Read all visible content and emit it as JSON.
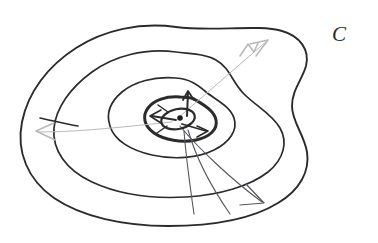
{
  "figure": {
    "background_color": "#ffffff",
    "ink_color": "#2b2b2b",
    "faint_ink_color": "#b9b9bd",
    "vector_ink_color": "#55555c",
    "width": 378,
    "height": 243
  },
  "labels": {
    "outer_curve": {
      "text": "C",
      "x": 338,
      "y": 28,
      "font_size": 21
    }
  },
  "contours": {
    "count": 4,
    "description": "Four nested closed hand-drawn curves, outermost labelled C",
    "items": [
      {
        "name": "outer-contour",
        "level": 1,
        "stroke_width": 1.9,
        "path": "M 176 27 C 140 22 104 30 76 48 C 48 66 28 92 22 122 C 16 152 28 180 54 198 C 82 217 124 226 168 226 C 212 226 252 219 278 203 C 300 190 310 171 307 152 C 304 134 292 122 292 106 C 292 90 302 80 306 66 C 310 50 300 36 282 31 C 258 24 212 32 176 27 Z"
      },
      {
        "name": "second-contour",
        "level": 2,
        "stroke_width": 1.7,
        "path": "M 176 52 C 144 48 114 56 92 72 C 70 88 56 108 54 128 C 52 150 66 170 92 182 C 118 194 152 199 186 197 C 220 195 250 186 268 172 C 284 159 288 142 280 128 C 272 114 256 106 244 94 C 232 82 230 68 216 60 C 206 54 192 54 176 52 Z"
      },
      {
        "name": "third-contour",
        "level": 3,
        "stroke_width": 1.7,
        "path": "M 176 78 C 154 76 134 82 122 92 C 110 102 106 114 110 126 C 114 140 130 150 152 155 C 174 160 198 158 214 150 C 230 142 238 130 234 118 C 230 106 216 100 206 92 C 198 85 190 79 176 78 Z"
      },
      {
        "name": "inner-contour",
        "level": 4,
        "stroke_width": 3.0,
        "path": "M 180 97 C 166 96 154 100 148 108 C 142 116 144 126 154 133 C 164 140 182 143 196 140 C 210 137 218 129 216 120 C 214 110 202 104 194 99 C 189 97 185 97 180 97 Z"
      }
    ]
  },
  "center_feature": {
    "name": "critical-point",
    "description": "Small filled oval with a solid dot at the center of the innermost contour",
    "oval": {
      "cx": 178,
      "cy": 119,
      "rx": 17,
      "ry": 10,
      "rotation": -12,
      "stroke_width": 2.2
    },
    "dot": {
      "cx": 180,
      "cy": 118,
      "r": 2.6,
      "color": "#1f1f1f"
    }
  },
  "vectors": {
    "description": "Arrows radiating from the centre critical point outwards",
    "items": [
      {
        "name": "vector-upper-right",
        "direction": "up-right",
        "style": "faint",
        "from": [
          178,
          118
        ],
        "to": [
          268,
          40
        ],
        "arrowhead": [
          [
            250,
            44
          ],
          [
            268,
            40
          ],
          [
            256,
            56
          ]
        ]
      },
      {
        "name": "vector-lower-right",
        "direction": "down-right",
        "style": "solid",
        "from": [
          178,
          126
        ],
        "to": [
          262,
          200
        ],
        "arrowhead": [
          [
            246,
            186
          ],
          [
            264,
            202
          ],
          [
            242,
            204
          ]
        ]
      },
      {
        "name": "vector-down",
        "direction": "down",
        "style": "solid",
        "from": [
          186,
          130
        ],
        "to": [
          232,
          212
        ],
        "arrowhead": null
      },
      {
        "name": "vector-left",
        "direction": "left",
        "style": "faint",
        "from": [
          172,
          122
        ],
        "to": [
          36,
          132
        ],
        "arrowhead": [
          [
            52,
            124
          ],
          [
            34,
            132
          ],
          [
            52,
            140
          ]
        ]
      },
      {
        "name": "vector-up-short",
        "direction": "up",
        "style": "solid",
        "from": [
          186,
          116
        ],
        "to": [
          188,
          93
        ],
        "arrowhead": [
          [
            183,
            100
          ],
          [
            188,
            92
          ],
          [
            193,
            100
          ]
        ]
      },
      {
        "name": "vector-left-short",
        "direction": "left-short",
        "style": "solid",
        "from": [
          176,
          120
        ],
        "to": [
          152,
          116
        ],
        "arrowhead": [
          [
            160,
            110
          ],
          [
            150,
            116
          ],
          [
            160,
            123
          ]
        ]
      },
      {
        "name": "vector-right-short",
        "direction": "right-short",
        "style": "solid",
        "from": [
          182,
          124
        ],
        "to": [
          206,
          131
        ],
        "arrowhead": [
          [
            197,
            126
          ],
          [
            208,
            131
          ],
          [
            197,
            137
          ]
        ]
      }
    ]
  }
}
